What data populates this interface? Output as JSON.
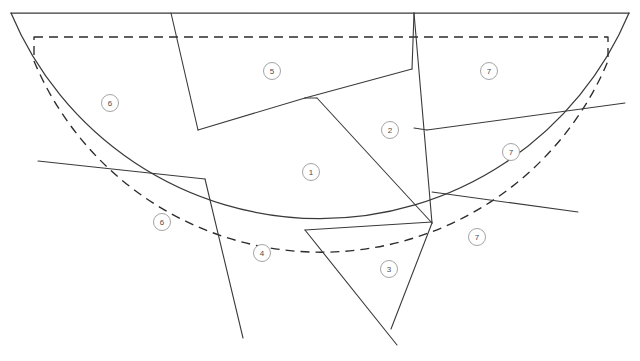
{
  "figure": {
    "canvas": {
      "width": 640,
      "height": 361
    },
    "background_color": "#ffffff",
    "line_color": "#3a3a3a",
    "dashed_color": "#2b2b2b",
    "label_circle_stroke": "#9a9a9a",
    "label_text_color": "#4a4a4a"
  },
  "outline": {
    "type": "half-disc",
    "center": {
      "x": 320,
      "y": 13
    },
    "radius": 335,
    "top_edge": {
      "x1": 11,
      "y1": 13,
      "x2": 629,
      "y2": 13
    },
    "arc_path": "M 11 13 A 335 335 0 0 0 629 13"
  },
  "offset_boundary": {
    "style": "dashed",
    "inset": 23,
    "path": "M 34 37 L 608 37 L 608 61 A 311 311 0 0 1 34 61 Z",
    "straight_top": {
      "x1": 34,
      "y1": 37,
      "x2": 608,
      "y2": 37
    },
    "arc": {
      "center": {
        "x": 320,
        "y": 37
      },
      "radius": 311
    }
  },
  "partition_lines": [
    {
      "name": "line-top-left-radial",
      "points": "171,13 198,130"
    },
    {
      "name": "line-six-split",
      "points": "38,161 205,179"
    },
    {
      "name": "line-region4-left",
      "points": "205,179 243,338"
    },
    {
      "name": "line-region1-upper-left",
      "points": "198,130 305,98"
    },
    {
      "name": "line-region1-top",
      "points": "305,98 317,98"
    },
    {
      "name": "line-region5-to-2",
      "points": "305,98 412,69"
    },
    {
      "name": "line-region2-radial",
      "points": "412,69 414,13"
    },
    {
      "name": "line-region2-right",
      "points": "414,13 432,223"
    },
    {
      "name": "line-region1-right-diag",
      "points": "317,98 432,223"
    },
    {
      "name": "line-region1-bottom",
      "points": "305,230 432,222"
    },
    {
      "name": "line-region4-right",
      "points": "305,230 397,345"
    },
    {
      "name": "line-seven-upper-split",
      "points": "427,130 625,103"
    },
    {
      "name": "line-seven-lower-split",
      "points": "432,192 578,212"
    },
    {
      "name": "line-region2-notch",
      "points": "414,128 427,130"
    },
    {
      "name": "line-region7-bottom-radial",
      "points": "432,223 391,329"
    }
  ],
  "regions": [
    {
      "id": "region-1",
      "label": "1",
      "label_x": 311,
      "label_y": 172
    },
    {
      "id": "region-2",
      "label": "2",
      "label_x": 390,
      "label_y": 130
    },
    {
      "id": "region-3",
      "label": "3",
      "label_x": 389,
      "label_y": 269
    },
    {
      "id": "region-4",
      "label": "4",
      "label_x": 262,
      "label_y": 253
    },
    {
      "id": "region-5",
      "label": "5",
      "label_x": 272,
      "label_y": 71
    },
    {
      "id": "region-6-upper",
      "label": "6",
      "label_x": 110,
      "label_y": 103
    },
    {
      "id": "region-6-lower",
      "label": "6",
      "label_x": 162,
      "label_y": 222
    },
    {
      "id": "region-7-top",
      "label": "7",
      "label_x": 489,
      "label_y": 71
    },
    {
      "id": "region-7-middle",
      "label": "7",
      "label_x": 511,
      "label_y": 152
    },
    {
      "id": "region-7-bottom",
      "label": "7",
      "label_x": 477,
      "label_y": 237
    }
  ],
  "label_marker": {
    "shape": "circle",
    "radius": 8.5,
    "font_size": 8
  }
}
